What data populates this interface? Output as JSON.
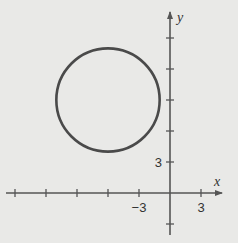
{
  "chart_data": {
    "type": "scatter",
    "title": "",
    "xlabel": "x",
    "ylabel": "y",
    "xlim": [
      -16,
      5
    ],
    "ylim": [
      -3,
      17
    ],
    "grid": false,
    "tick_step": 3,
    "x_ticks": [
      -15,
      -12,
      -9,
      -6,
      -3,
      3
    ],
    "y_ticks": [
      -3,
      3,
      6,
      9,
      12,
      15
    ],
    "x_tick_labels": [
      {
        "value": -3,
        "label": "−3"
      },
      {
        "value": 3,
        "label": "3"
      }
    ],
    "y_tick_labels": [
      {
        "value": 3,
        "label": "3"
      }
    ],
    "shapes": [
      {
        "kind": "circle",
        "center": [
          -6,
          9
        ],
        "radius": 5
      }
    ],
    "colors": {
      "curve": "#4a4a4a",
      "axes": "#555555",
      "background": "#e9e9e7"
    }
  }
}
